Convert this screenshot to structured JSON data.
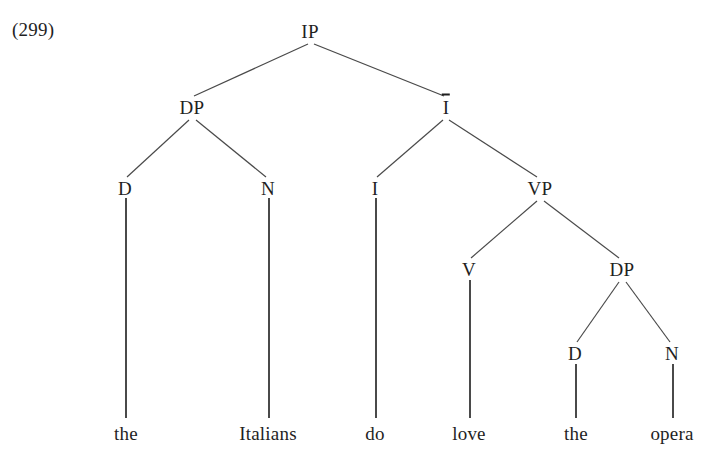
{
  "figure": {
    "example_number": "(299)",
    "sentence": "the Italians do love the opera",
    "line_color": "#4a4a4a",
    "text_color": "#1f1f1f",
    "background_color": "#ffffff"
  },
  "tree": {
    "nodes": [
      {
        "id": "IP",
        "label": "IP",
        "x": 310,
        "y": 31,
        "bar": false
      },
      {
        "id": "DP1",
        "label": "DP",
        "x": 192,
        "y": 107,
        "bar": false
      },
      {
        "id": "Ibar",
        "label": "I",
        "x": 446,
        "y": 107,
        "bar": true
      },
      {
        "id": "D1",
        "label": "D",
        "x": 125,
        "y": 188,
        "bar": false
      },
      {
        "id": "N1",
        "label": "N",
        "x": 268,
        "y": 188,
        "bar": false
      },
      {
        "id": "I0",
        "label": "I",
        "x": 375,
        "y": 188,
        "bar": false
      },
      {
        "id": "VP",
        "label": "VP",
        "x": 540,
        "y": 188,
        "bar": false
      },
      {
        "id": "V0",
        "label": "V",
        "x": 469,
        "y": 269,
        "bar": false
      },
      {
        "id": "DP2",
        "label": "DP",
        "x": 622,
        "y": 269,
        "bar": false
      },
      {
        "id": "D2",
        "label": "D",
        "x": 575,
        "y": 353,
        "bar": false
      },
      {
        "id": "N2",
        "label": "N",
        "x": 672,
        "y": 353,
        "bar": false
      }
    ],
    "edges": [
      {
        "from": "IP",
        "to": "DP1",
        "x1": 308,
        "y1": 44,
        "x2": 194,
        "y2": 96
      },
      {
        "from": "IP",
        "to": "Ibar",
        "x1": 314,
        "y1": 44,
        "x2": 444,
        "y2": 96
      },
      {
        "from": "DP1",
        "to": "D1",
        "x1": 189,
        "y1": 120,
        "x2": 127,
        "y2": 177
      },
      {
        "from": "DP1",
        "to": "N1",
        "x1": 196,
        "y1": 120,
        "x2": 266,
        "y2": 177
      },
      {
        "from": "Ibar",
        "to": "I0",
        "x1": 443,
        "y1": 120,
        "x2": 377,
        "y2": 177
      },
      {
        "from": "Ibar",
        "to": "VP",
        "x1": 449,
        "y1": 120,
        "x2": 537,
        "y2": 177
      },
      {
        "from": "VP",
        "to": "V0",
        "x1": 537,
        "y1": 201,
        "x2": 471,
        "y2": 258
      },
      {
        "from": "VP",
        "to": "DP2",
        "x1": 544,
        "y1": 201,
        "x2": 619,
        "y2": 258
      },
      {
        "from": "DP2",
        "to": "D2",
        "x1": 619,
        "y1": 282,
        "x2": 577,
        "y2": 342
      },
      {
        "from": "DP2",
        "to": "N2",
        "x1": 626,
        "y1": 282,
        "x2": 670,
        "y2": 342
      }
    ],
    "terminals": [
      {
        "id": "w-the-1",
        "word": "the",
        "parent": "D1",
        "x": 126,
        "y": 433,
        "stem_y1": 198,
        "stem_y2": 418
      },
      {
        "id": "w-italians",
        "word": "Italians",
        "parent": "N1",
        "x": 268,
        "y": 433,
        "stem_y1": 198,
        "stem_y2": 418
      },
      {
        "id": "w-do",
        "word": "do",
        "parent": "I0",
        "x": 375,
        "y": 433,
        "stem_y1": 198,
        "stem_y2": 418
      },
      {
        "id": "w-love",
        "word": "love",
        "parent": "V0",
        "x": 469,
        "y": 433,
        "stem_y1": 280,
        "stem_y2": 418
      },
      {
        "id": "w-the-2",
        "word": "the",
        "parent": "D2",
        "x": 576,
        "y": 433,
        "stem_y1": 364,
        "stem_y2": 418
      },
      {
        "id": "w-opera",
        "word": "opera",
        "parent": "N2",
        "x": 672,
        "y": 433,
        "stem_y1": 364,
        "stem_y2": 418
      }
    ]
  }
}
